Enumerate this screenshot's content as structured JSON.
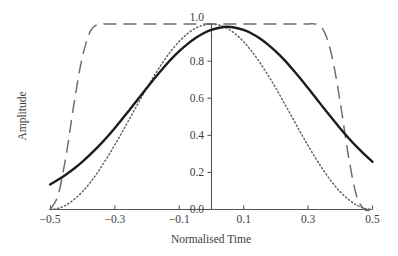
{
  "chart_data": {
    "type": "line",
    "title": "",
    "xlabel": "Normalised Time",
    "ylabel": "Amplitude",
    "xlim": [
      -0.5,
      0.5
    ],
    "ylim": [
      0.0,
      1.0
    ],
    "grid": false,
    "legend": "none",
    "xticks": [
      -0.5,
      -0.3,
      -0.1,
      0.1,
      0.3,
      0.5
    ],
    "xtick_labels": [
      "−0.5",
      "−0.3",
      "−0.1",
      "0.1",
      "0.3",
      "0.5"
    ],
    "yticks": [
      0.0,
      0.2,
      0.4,
      0.6,
      0.8,
      1.0
    ],
    "ytick_labels": [
      "0.0",
      "0.2",
      "0.4",
      "0.6",
      "0.8",
      "1.0"
    ],
    "x": [
      -0.5,
      -0.475,
      -0.45,
      -0.425,
      -0.4,
      -0.375,
      -0.35,
      -0.325,
      -0.3,
      -0.275,
      -0.25,
      -0.225,
      -0.2,
      -0.175,
      -0.15,
      -0.125,
      -0.1,
      -0.075,
      -0.05,
      -0.025,
      0.0,
      0.025,
      0.05,
      0.075,
      0.1,
      0.125,
      0.15,
      0.175,
      0.2,
      0.225,
      0.25,
      0.275,
      0.3,
      0.325,
      0.35,
      0.375,
      0.4,
      0.425,
      0.45,
      0.475,
      0.5
    ],
    "series": [
      {
        "name": "gaussian-window",
        "style": "solid",
        "color": "#1c1c1c",
        "values": [
          0.135,
          0.16,
          0.189,
          0.221,
          0.257,
          0.297,
          0.34,
          0.387,
          0.437,
          0.49,
          0.544,
          0.6,
          0.655,
          0.709,
          0.76,
          0.809,
          0.852,
          0.89,
          0.923,
          0.949,
          0.968,
          0.98,
          0.985,
          0.98,
          0.968,
          0.949,
          0.923,
          0.89,
          0.852,
          0.809,
          0.76,
          0.709,
          0.655,
          0.6,
          0.544,
          0.49,
          0.437,
          0.387,
          0.34,
          0.297,
          0.257
        ]
      },
      {
        "name": "hann-window",
        "style": "dotted",
        "color": "#636363",
        "values": [
          0.0,
          0.006,
          0.024,
          0.055,
          0.095,
          0.146,
          0.206,
          0.273,
          0.345,
          0.421,
          0.5,
          0.578,
          0.655,
          0.727,
          0.794,
          0.854,
          0.905,
          0.946,
          0.976,
          0.994,
          1.0,
          0.994,
          0.976,
          0.946,
          0.905,
          0.854,
          0.794,
          0.727,
          0.655,
          0.578,
          0.5,
          0.421,
          0.345,
          0.273,
          0.206,
          0.146,
          0.095,
          0.055,
          0.024,
          0.006,
          0.0
        ]
      },
      {
        "name": "flat-top-tukey-window",
        "style": "dashed",
        "color": "#6e6e6e",
        "values": [
          0.0,
          0.077,
          0.292,
          0.577,
          0.82,
          0.96,
          0.999,
          1.0,
          1.0,
          1.0,
          1.0,
          1.0,
          1.0,
          1.0,
          1.0,
          1.0,
          1.0,
          1.0,
          1.0,
          1.0,
          1.0,
          1.0,
          1.0,
          1.0,
          1.0,
          1.0,
          1.0,
          1.0,
          1.0,
          1.0,
          1.0,
          1.0,
          1.0,
          0.999,
          0.96,
          0.82,
          0.577,
          0.292,
          0.077,
          0.0,
          0.0
        ]
      }
    ]
  },
  "axes": {
    "x_title": "Normalised Time",
    "y_title": "Amplitude"
  }
}
